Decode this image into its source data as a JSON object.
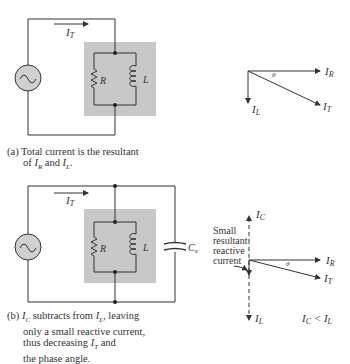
{
  "figure_a": {
    "labels": {
      "total_current": "I",
      "total_current_sub": "T",
      "resistor": "R",
      "inductor": "L"
    },
    "phasor": {
      "ir": "I",
      "ir_sub": "R",
      "il": "I",
      "il_sub": "L",
      "it": "I",
      "it_sub": "T",
      "theta": "θ"
    },
    "caption_line1": "(a) Total current is the resultant",
    "caption_line2_pre": "of ",
    "caption_line2_mid": " and ",
    "caption_line2_end": "."
  },
  "figure_b": {
    "labels": {
      "total_current": "I",
      "total_current_sub": "T",
      "resistor": "R",
      "inductor": "L",
      "capacitor": "C",
      "capacitor_sub": "x"
    },
    "phasor": {
      "ic": "I",
      "ic_sub": "C",
      "ir": "I",
      "ir_sub": "R",
      "it": "I",
      "it_sub": "T",
      "il": "I",
      "il_sub": "L",
      "theta": "θ",
      "annotation": [
        "Small",
        "resultant",
        "reactive",
        "current"
      ],
      "relation": "IC < IL"
    },
    "caption_line1": "(b) IC subtracts from IL, leaving",
    "caption_line2": "only a small reactive current,",
    "caption_line3": "thus decreasing IT and",
    "caption_line4": "the phase angle."
  },
  "colors": {
    "line": "#333333",
    "shade": "#c8c8c8",
    "source_fill": "#d0d0d0"
  }
}
